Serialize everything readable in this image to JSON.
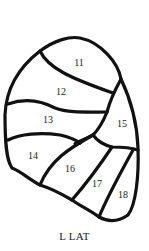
{
  "diagram": {
    "caption": "L LAT",
    "segments": [
      {
        "id": "11",
        "label": "11",
        "x": 79,
        "y": 66
      },
      {
        "id": "12",
        "label": "12",
        "x": 55,
        "y": 95
      },
      {
        "id": "13",
        "label": "13",
        "x": 41,
        "y": 123
      },
      {
        "id": "14",
        "label": "14",
        "x": 27,
        "y": 159
      },
      {
        "id": "15",
        "label": "15",
        "x": 113,
        "y": 127
      },
      {
        "id": "16",
        "label": "16",
        "x": 64,
        "y": 172
      },
      {
        "id": "17",
        "label": "17",
        "x": 91,
        "y": 187
      },
      {
        "id": "18",
        "label": "18",
        "x": 116,
        "y": 198
      }
    ],
    "colors": {
      "line": "#111111",
      "background": "#ffffff",
      "text": "#222222"
    }
  }
}
